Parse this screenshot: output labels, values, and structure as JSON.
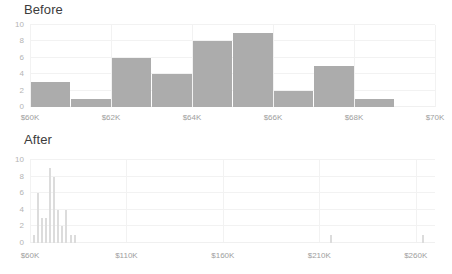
{
  "charts": [
    {
      "title": "Before",
      "ylabel": "",
      "xlabel": "",
      "yticks": [
        "0",
        "2",
        "4",
        "6",
        "8",
        "10"
      ],
      "xticks": [
        "$60K",
        "$62K",
        "$64K",
        "$66K",
        "$68K",
        "$70K"
      ]
    },
    {
      "title": "After",
      "ylabel": "",
      "xlabel": "",
      "yticks": [
        "0",
        "2",
        "4",
        "6",
        "8",
        "10"
      ],
      "xticks": [
        "$60K",
        "$110K",
        "$160K",
        "$210K",
        "$260K"
      ]
    }
  ],
  "colors": {
    "bar_before": "#acacac",
    "bar_after": "#dcdcdc",
    "grid": "#f2f2f2",
    "title_text": "#3c3c3c",
    "tick_text": "#9e9e9e",
    "background": "#ffffff"
  },
  "chart_data": [
    {
      "type": "bar",
      "title": "Before",
      "subtitle": "",
      "xlabel": "",
      "ylabel": "",
      "xlim": [
        60000,
        70000
      ],
      "ylim": [
        0,
        10
      ],
      "grid": true,
      "legend": "none",
      "bin_width": 1000,
      "categories": [
        "$60K–$61K",
        "$61K–$62K",
        "$62K–$63K",
        "$63K–$64K",
        "$64K–$65K",
        "$65K–$66K",
        "$66K–$67K",
        "$67K–$68K",
        "$68K–$69K",
        "$69K–$70K"
      ],
      "bin_edges": [
        60000,
        61000,
        62000,
        63000,
        64000,
        65000,
        66000,
        67000,
        68000,
        69000,
        70000
      ],
      "values": [
        3,
        1,
        6,
        4,
        8,
        9,
        2,
        5,
        1,
        0
      ],
      "xtick_labels": [
        "$60K",
        "$62K",
        "$64K",
        "$66K",
        "$68K",
        "$70K"
      ],
      "xtick_values": [
        60000,
        62000,
        64000,
        66000,
        68000,
        70000
      ],
      "ytick_labels": [
        "0",
        "2",
        "4",
        "6",
        "8",
        "10"
      ],
      "ytick_values": [
        0,
        2,
        4,
        6,
        8,
        10
      ]
    },
    {
      "type": "bar",
      "title": "After",
      "subtitle": "",
      "xlabel": "",
      "ylabel": "",
      "xlim": [
        60000,
        270000
      ],
      "ylim": [
        0,
        10
      ],
      "grid": true,
      "legend": "none",
      "bin_width": 2100,
      "categories": [
        "$62.1K",
        "$64.2K",
        "$66.3K",
        "$68.4K",
        "$70.5K",
        "$72.6K",
        "$74.7K",
        "$76.8K",
        "$78.9K",
        "$81.0K",
        "$83.1K",
        "$216K",
        "$264K"
      ],
      "bin_centers": [
        62100,
        64200,
        66300,
        68400,
        70500,
        72600,
        74700,
        76800,
        78900,
        81000,
        83100,
        216000,
        264000
      ],
      "values": [
        1,
        6,
        3,
        3,
        9,
        8,
        4,
        2,
        4,
        1,
        1,
        1,
        1
      ],
      "xtick_labels": [
        "$60K",
        "$110K",
        "$160K",
        "$210K",
        "$260K"
      ],
      "xtick_values": [
        60000,
        110000,
        160000,
        210000,
        260000
      ],
      "ytick_labels": [
        "0",
        "2",
        "4",
        "6",
        "8",
        "10"
      ],
      "ytick_values": [
        0,
        2,
        4,
        6,
        8,
        10
      ]
    }
  ]
}
